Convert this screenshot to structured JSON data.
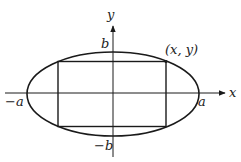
{
  "diagram": {
    "axes": {
      "x_label": "x",
      "y_label": "y"
    },
    "intercepts": {
      "pos_x": "a",
      "neg_x": "−a",
      "pos_y": "b",
      "neg_y": "−b"
    },
    "point_label": "(x, y)",
    "colors": {
      "stroke": "#1a1a1a",
      "background": "#ffffff"
    }
  }
}
